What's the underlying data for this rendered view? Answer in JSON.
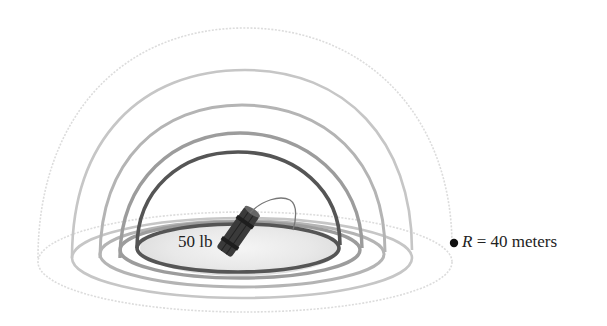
{
  "diagram": {
    "charge": {
      "label": "50 lb",
      "icon": "dynamite-icon"
    },
    "distance_marker": {
      "variable": "R",
      "equals": "=",
      "value": "40 meters",
      "icon": "point-dot-icon"
    },
    "hemispheres": [
      {
        "name": "inner",
        "color": "#555555"
      },
      {
        "name": "second",
        "color": "#999999"
      },
      {
        "name": "third",
        "color": "#b0b0b0"
      },
      {
        "name": "fourth",
        "color": "#c4c4c4"
      },
      {
        "name": "outer",
        "color": "#dcdcdc"
      }
    ]
  }
}
